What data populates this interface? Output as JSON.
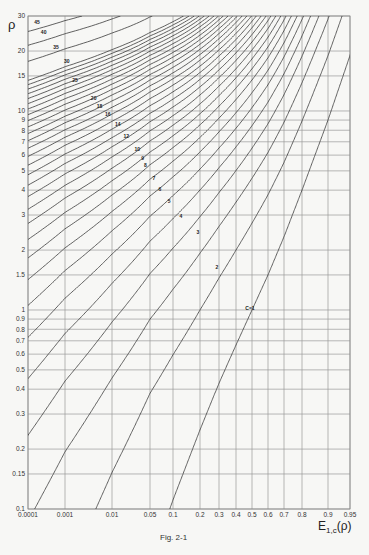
{
  "chart_data": {
    "type": "line",
    "title": "",
    "caption": "Fig. 2-1",
    "xlabel": "E1,c(ρ)",
    "xlabel_main": "E",
    "xlabel_sub": "1,c",
    "xlabel_tail": "(ρ)",
    "ylabel": "ρ",
    "x_scale": "nonlinear (probability)",
    "y_scale": "log",
    "xlim": [
      0.0001,
      0.95
    ],
    "ylim": [
      0.1,
      30
    ],
    "grid": true,
    "x_ticks": [
      {
        "value": 0.0001,
        "label": "0.0001",
        "px": 28
      },
      {
        "value": 0.001,
        "label": "0.001",
        "px": 65
      },
      {
        "value": 0.01,
        "label": "0.01",
        "px": 112
      },
      {
        "value": 0.05,
        "label": "0.05",
        "px": 150
      },
      {
        "value": 0.1,
        "label": "0.1",
        "px": 173
      },
      {
        "value": 0.2,
        "label": "0.2",
        "px": 200
      },
      {
        "value": 0.3,
        "label": "0.3",
        "px": 219
      },
      {
        "value": 0.4,
        "label": "0.4",
        "px": 236
      },
      {
        "value": 0.5,
        "label": "0.5",
        "px": 252
      },
      {
        "value": 0.6,
        "label": "0.6",
        "px": 268
      },
      {
        "value": 0.7,
        "label": "0.7",
        "px": 284
      },
      {
        "value": 0.8,
        "label": "0.8",
        "px": 302
      },
      {
        "value": 0.9,
        "label": "0.9",
        "px": 328
      },
      {
        "value": 0.95,
        "label": "0.95",
        "px": 350
      }
    ],
    "y_ticks": [
      {
        "value": 30,
        "label": "30"
      },
      {
        "value": 20,
        "label": "20"
      },
      {
        "value": 15,
        "label": "15"
      },
      {
        "value": 10,
        "label": "10"
      },
      {
        "value": 9,
        "label": "9"
      },
      {
        "value": 8,
        "label": "8"
      },
      {
        "value": 7,
        "label": "7"
      },
      {
        "value": 6,
        "label": "6"
      },
      {
        "value": 5,
        "label": "5"
      },
      {
        "value": 4,
        "label": "4"
      },
      {
        "value": 3,
        "label": "3"
      },
      {
        "value": 2,
        "label": "2"
      },
      {
        "value": 1.5,
        "label": "1.5"
      },
      {
        "value": 1,
        "label": "1"
      },
      {
        "value": 0.9,
        "label": "0.9"
      },
      {
        "value": 0.8,
        "label": "0.8"
      },
      {
        "value": 0.7,
        "label": "0.7"
      },
      {
        "value": 0.6,
        "label": "0.6"
      },
      {
        "value": 0.5,
        "label": "0.5"
      },
      {
        "value": 0.4,
        "label": "0.4"
      },
      {
        "value": 0.3,
        "label": "0.3"
      },
      {
        "value": 0.2,
        "label": "0.2"
      },
      {
        "value": 0.15,
        "label": "0.15"
      },
      {
        "value": 0.1,
        "label": "0.1"
      }
    ],
    "series_description": "Erlang loss formula E1,c(ρ) for c servers; curves for c = 1..45",
    "series": [
      {
        "c": 1,
        "label": "C=1",
        "label_at": [
          0.5,
          1.0
        ]
      },
      {
        "c": 2,
        "label": "2",
        "label_at": [
          0.3,
          1.6
        ]
      },
      {
        "c": 3,
        "label": "3",
        "label_at": [
          0.2,
          2.4
        ]
      },
      {
        "c": 4,
        "label": "4",
        "label_at": [
          0.13,
          2.9
        ]
      },
      {
        "c": 5,
        "label": "5",
        "label_at": [
          0.095,
          3.45
        ]
      },
      {
        "c": 6,
        "label": "6",
        "label_at": [
          0.072,
          3.95
        ]
      },
      {
        "c": 7,
        "label": "7",
        "label_at": [
          0.06,
          4.5
        ]
      },
      {
        "c": 8,
        "label": "8",
        "label_at": [
          0.045,
          5.2
        ]
      },
      {
        "c": 9,
        "label": "9",
        "label_at": [
          0.04,
          5.7
        ]
      },
      {
        "c": 10,
        "label": "10",
        "label_at": [
          0.032,
          6.3
        ]
      },
      {
        "c": 11,
        "label": "",
        "label_at": null
      },
      {
        "c": 12,
        "label": "12",
        "label_at": [
          0.02,
          7.3
        ]
      },
      {
        "c": 13,
        "label": "",
        "label_at": null
      },
      {
        "c": 14,
        "label": "14",
        "label_at": [
          0.014,
          8.4
        ]
      },
      {
        "c": 15,
        "label": "",
        "label_at": null
      },
      {
        "c": 16,
        "label": "16",
        "label_at": [
          0.009,
          9.4
        ]
      },
      {
        "c": 17,
        "label": "",
        "label_at": null
      },
      {
        "c": 18,
        "label": "18",
        "label_at": [
          0.006,
          10.3
        ]
      },
      {
        "c": 19,
        "label": "",
        "label_at": null
      },
      {
        "c": 20,
        "label": "20",
        "label_at": [
          0.0045,
          11.3
        ]
      },
      {
        "c": 25,
        "label": "25",
        "label_at": [
          0.0018,
          14.0
        ]
      },
      {
        "c": 30,
        "label": "30",
        "label_at": [
          0.0012,
          17.5
        ]
      },
      {
        "c": 35,
        "label": "35",
        "label_at": [
          0.00065,
          20.5
        ]
      },
      {
        "c": 40,
        "label": "40",
        "label_at": [
          0.0003,
          24.5
        ]
      },
      {
        "c": 45,
        "label": "45",
        "label_at": [
          0.0002,
          27.5
        ]
      }
    ],
    "extra_curves_c": [
      21,
      22,
      23,
      24,
      26,
      27,
      28,
      29
    ]
  },
  "plot": {
    "left": 28,
    "right": 350,
    "top": 16,
    "bottom": 509
  }
}
